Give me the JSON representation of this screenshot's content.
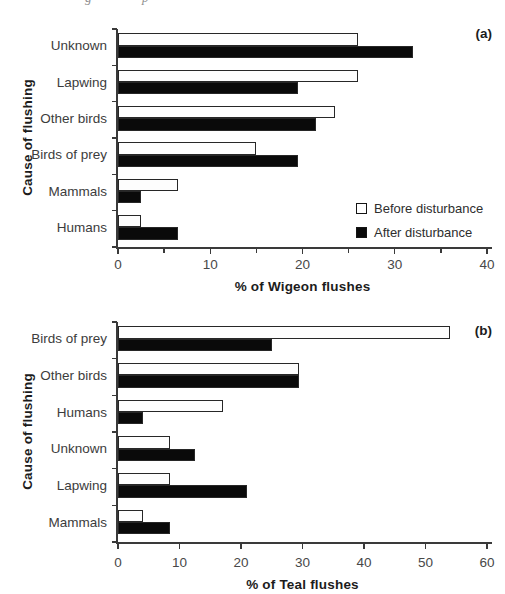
{
  "artifacts": {
    "fragment_left": "g",
    "fragment_right": "p"
  },
  "colors": {
    "before_fill": "#ffffff",
    "after_fill": "#000000",
    "bar_border": "#272727",
    "axis": "#3a3a3a"
  },
  "chart_data": [
    {
      "type": "bar",
      "orientation": "horizontal",
      "panel_label": "(a)",
      "xlabel": "% of Wigeon flushes",
      "ylabel": "Cause of flushing",
      "categories": [
        "Unknown",
        "Lapwing",
        "Other birds",
        "Birds of prey",
        "Mammals",
        "Humans"
      ],
      "series": [
        {
          "name": "Before disturbance",
          "fill": "#ffffff",
          "values": [
            26,
            26,
            23.5,
            15,
            6.5,
            2.5
          ]
        },
        {
          "name": "After disturbance",
          "fill": "#000000",
          "values": [
            32,
            19.5,
            21.5,
            19.5,
            2.5,
            6.5
          ]
        }
      ],
      "xlim": [
        0,
        40
      ],
      "tick_major": 10,
      "tick_minor": 5,
      "grid": false,
      "legend_position": "inside lower right"
    },
    {
      "type": "bar",
      "orientation": "horizontal",
      "panel_label": "(b)",
      "xlabel": "% of Teal flushes",
      "ylabel": "Cause of flushing",
      "categories": [
        "Birds of prey",
        "Other birds",
        "Humans",
        "Unknown",
        "Lapwing",
        "Mammals"
      ],
      "series": [
        {
          "name": "Before disturbance",
          "fill": "#ffffff",
          "values": [
            54,
            29.5,
            17,
            8.5,
            8.5,
            4
          ]
        },
        {
          "name": "After disturbance",
          "fill": "#000000",
          "values": [
            25,
            29.5,
            4,
            12.5,
            21,
            8.5
          ]
        }
      ],
      "xlim": [
        0,
        60
      ],
      "tick_major": 10,
      "tick_minor": null,
      "grid": false,
      "legend_position": "none"
    }
  ]
}
